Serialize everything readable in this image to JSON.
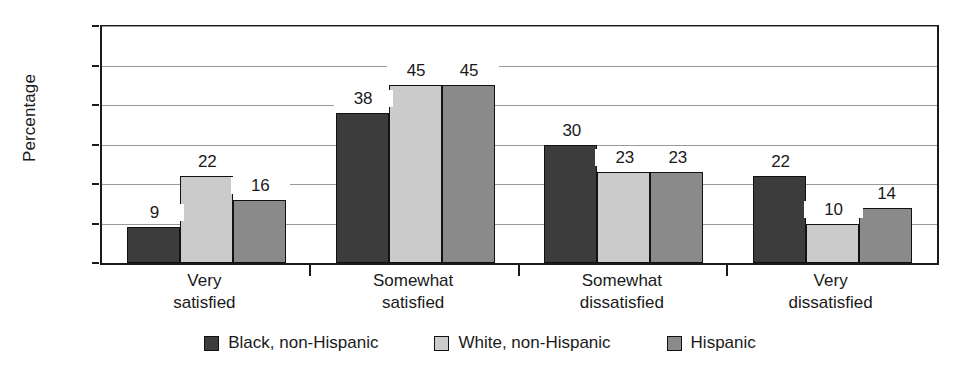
{
  "chart_data": {
    "type": "bar",
    "title": "",
    "subtitle": "",
    "xlabel": "",
    "ylabel": "Percentage",
    "ylim": [
      0,
      60
    ],
    "y_ticks": [
      0,
      10,
      20,
      30,
      40,
      50,
      60
    ],
    "grid": true,
    "legend_position": "bottom",
    "categories": [
      "Very\nsatisfied",
      "Somewhat\nsatisfied",
      "Somewhat\ndissatisfied",
      "Very\ndissatisfied"
    ],
    "category_lines": [
      [
        "Very",
        "satisfied"
      ],
      [
        "Somewhat",
        "satisfied"
      ],
      [
        "Somewhat",
        "dissatisfied"
      ],
      [
        "Very",
        "dissatisfied"
      ]
    ],
    "series": [
      {
        "name": "Black, non-Hispanic",
        "color": "#3c3c3c",
        "values": [
          9,
          38,
          30,
          22
        ]
      },
      {
        "name": "White, non-Hispanic",
        "color": "#cbcbcb",
        "values": [
          22,
          45,
          23,
          10
        ]
      },
      {
        "name": "Hispanic",
        "color": "#8a8a8a",
        "values": [
          16,
          45,
          23,
          14
        ]
      }
    ],
    "data_labels": [
      [
        "9",
        "22",
        "16"
      ],
      [
        "38",
        "45",
        "45"
      ],
      [
        "30",
        "23",
        "23"
      ],
      [
        "22",
        "10",
        "14"
      ]
    ]
  },
  "axis": {
    "y_title": "Percentage",
    "y_tick_labels": [
      "0",
      "10",
      "20",
      "30",
      "40",
      "50",
      "60"
    ]
  },
  "legend": {
    "items": [
      {
        "label": "Black, non-Hispanic",
        "color": "#3c3c3c"
      },
      {
        "label": "White, non-Hispanic",
        "color": "#cbcbcb"
      },
      {
        "label": "Hispanic",
        "color": "#8a8a8a"
      }
    ]
  },
  "colors": {
    "axis": "#1a1a1a",
    "gridline": "#9a9a9a",
    "background": "#ffffff",
    "bar_outline": "#111111"
  }
}
